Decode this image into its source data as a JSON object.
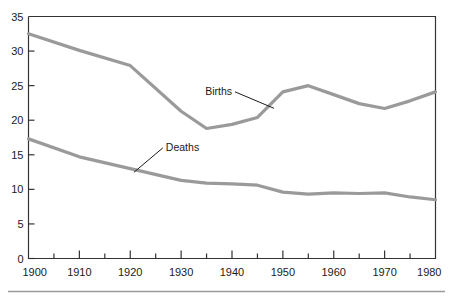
{
  "chart_data": {
    "type": "line",
    "title": "",
    "subtitle": "",
    "xlabel": "",
    "ylabel": "",
    "xlim": [
      1900,
      1980
    ],
    "ylim": [
      0,
      35
    ],
    "grid": false,
    "legend_position": "inline-annotations",
    "x_ticks_major": [
      1900,
      1910,
      1920,
      1930,
      1940,
      1950,
      1960,
      1970,
      1980
    ],
    "x_ticks_minor": [
      1905,
      1915,
      1925,
      1935,
      1945,
      1955,
      1965,
      1975
    ],
    "x_tick_labels": [
      "1900",
      "1910",
      "1920",
      "1930",
      "1940",
      "1950",
      "1960",
      "1970",
      "1980"
    ],
    "y_ticks": [
      0,
      5,
      10,
      15,
      20,
      25,
      30,
      35
    ],
    "y_tick_labels": [
      "0",
      "5",
      "10",
      "15",
      "20",
      "25",
      "30",
      "35"
    ],
    "x": [
      1900,
      1910,
      1920,
      1930,
      1935,
      1940,
      1945,
      1950,
      1955,
      1960,
      1965,
      1970,
      1975,
      1980
    ],
    "series": [
      {
        "name": "Births",
        "color": "#9a9a9a",
        "values": [
          32.5,
          30.1,
          27.9,
          21.3,
          18.8,
          19.4,
          20.4,
          24.1,
          25.0,
          23.7,
          22.4,
          21.7,
          22.8,
          24.1
        ]
      },
      {
        "name": "Deaths",
        "color": "#9a9a9a",
        "values": [
          17.3,
          14.7,
          13.0,
          11.3,
          10.9,
          10.8,
          10.6,
          9.6,
          9.3,
          9.5,
          9.4,
          9.5,
          8.9,
          8.5
        ]
      }
    ],
    "annotations": [
      {
        "text": "Births",
        "x": 1940,
        "y": 23.6
      },
      {
        "text": "Deaths",
        "x": 1927,
        "y": 15.5
      }
    ]
  },
  "axis": {
    "line_color": "#333333",
    "tick_color": "#333333"
  },
  "footer": {
    "rule_color": "#9a9a9a"
  }
}
